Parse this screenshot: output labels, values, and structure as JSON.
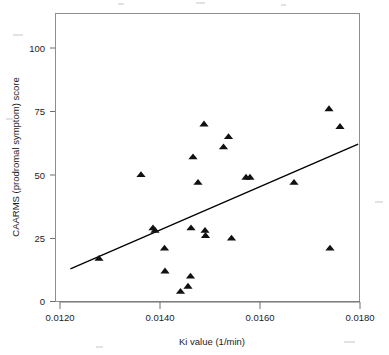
{
  "chart_data": {
    "type": "scatter",
    "title": "",
    "subtitle": "",
    "xlabel": "Ki value (1/min)",
    "ylabel": "CAARMS (prodromal symptom) score",
    "xlim": [
      0.0118,
      0.0182
    ],
    "ylim": [
      -4,
      112
    ],
    "xticks": [
      0.012,
      0.014,
      0.016,
      0.018
    ],
    "xticklabels": [
      "0.0120",
      "0.0140",
      "0.0160",
      "0.0180"
    ],
    "yticks": [
      0,
      25,
      50,
      75,
      100
    ],
    "yticklabels": [
      "0",
      "25",
      "50",
      "75",
      "100"
    ],
    "grid": false,
    "legend": null,
    "marker": "triangle",
    "marker_color": "#111111",
    "frame_color": "#8e8e8e",
    "points": [
      {
        "x": 0.01278,
        "y": 17
      },
      {
        "x": 0.01362,
        "y": 50
      },
      {
        "x": 0.01386,
        "y": 29
      },
      {
        "x": 0.0139,
        "y": 28
      },
      {
        "x": 0.01409,
        "y": 21
      },
      {
        "x": 0.0141,
        "y": 12
      },
      {
        "x": 0.01441,
        "y": 4
      },
      {
        "x": 0.01456,
        "y": 6
      },
      {
        "x": 0.01461,
        "y": 10
      },
      {
        "x": 0.01462,
        "y": 29
      },
      {
        "x": 0.01466,
        "y": 57
      },
      {
        "x": 0.01476,
        "y": 47
      },
      {
        "x": 0.01488,
        "y": 70
      },
      {
        "x": 0.0149,
        "y": 28
      },
      {
        "x": 0.01491,
        "y": 26
      },
      {
        "x": 0.01527,
        "y": 61
      },
      {
        "x": 0.01537,
        "y": 65
      },
      {
        "x": 0.01543,
        "y": 25
      },
      {
        "x": 0.01572,
        "y": 49
      },
      {
        "x": 0.0158,
        "y": 49
      },
      {
        "x": 0.01668,
        "y": 47
      },
      {
        "x": 0.01738,
        "y": 76
      },
      {
        "x": 0.0174,
        "y": 21
      },
      {
        "x": 0.0176,
        "y": 69
      }
    ],
    "trendline": {
      "name": "linear fit",
      "x_start": 0.01222,
      "y_start": 13,
      "x_end": 0.01795,
      "y_end": 62,
      "color": "#000000"
    }
  },
  "axes": {
    "y_axis_label": "CAARMS (prodromal symptom) score",
    "x_axis_label": "Ki value (1/min)"
  }
}
